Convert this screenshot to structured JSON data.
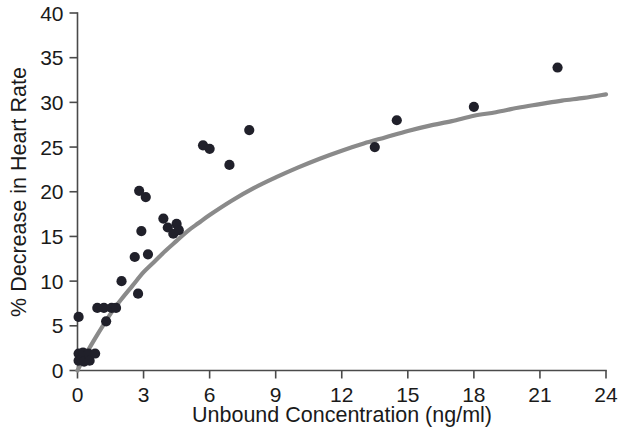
{
  "chart_data": {
    "type": "scatter",
    "title": "",
    "xlabel": "Unbound Concentration (ng/ml)",
    "ylabel": "% Decrease in Heart Rate",
    "xlim": [
      0,
      24
    ],
    "ylim": [
      0,
      40
    ],
    "xticks": [
      0,
      3,
      6,
      9,
      12,
      15,
      18,
      21,
      24
    ],
    "xtick_labels": [
      "0",
      "3",
      "6",
      "9",
      "12",
      "15",
      "18",
      "21",
      "24"
    ],
    "yticks": [
      0,
      5,
      10,
      15,
      20,
      25,
      30,
      35,
      40
    ],
    "ytick_labels": [
      "0",
      "5",
      "10",
      "15",
      "20",
      "25",
      "30",
      "35",
      "40"
    ],
    "grid": false,
    "legend": null,
    "marker": "filled-circle",
    "marker_color": "#20202a",
    "marker_size": 9,
    "curve_color": "#8a8a8a",
    "curve_label": "Emax fitted curve",
    "points": [
      {
        "x": 0.05,
        "y": 6.0
      },
      {
        "x": 0.05,
        "y": 1.9
      },
      {
        "x": 0.05,
        "y": 1.1
      },
      {
        "x": 0.25,
        "y": 2.0
      },
      {
        "x": 0.3,
        "y": 1.0
      },
      {
        "x": 0.5,
        "y": 1.9
      },
      {
        "x": 0.55,
        "y": 1.1
      },
      {
        "x": 0.8,
        "y": 1.9
      },
      {
        "x": 0.9,
        "y": 7.0
      },
      {
        "x": 1.2,
        "y": 7.0
      },
      {
        "x": 1.3,
        "y": 5.5
      },
      {
        "x": 1.55,
        "y": 7.0
      },
      {
        "x": 1.75,
        "y": 7.0
      },
      {
        "x": 2.0,
        "y": 10.0
      },
      {
        "x": 2.6,
        "y": 12.7
      },
      {
        "x": 2.75,
        "y": 8.6
      },
      {
        "x": 2.8,
        "y": 20.1
      },
      {
        "x": 2.9,
        "y": 15.6
      },
      {
        "x": 3.1,
        "y": 19.4
      },
      {
        "x": 3.2,
        "y": 13.0
      },
      {
        "x": 3.9,
        "y": 17.0
      },
      {
        "x": 4.1,
        "y": 16.0
      },
      {
        "x": 4.35,
        "y": 15.3
      },
      {
        "x": 4.5,
        "y": 16.4
      },
      {
        "x": 4.6,
        "y": 15.7
      },
      {
        "x": 5.7,
        "y": 25.2
      },
      {
        "x": 6.0,
        "y": 24.8
      },
      {
        "x": 6.9,
        "y": 23.0
      },
      {
        "x": 7.8,
        "y": 26.9
      },
      {
        "x": 13.5,
        "y": 25.0
      },
      {
        "x": 14.5,
        "y": 28.0
      },
      {
        "x": 18.0,
        "y": 29.5
      },
      {
        "x": 21.8,
        "y": 33.9
      }
    ],
    "curve": {
      "model": "Emax",
      "emax": 42.0,
      "ec50": 8.5,
      "points": [
        {
          "x": 0.0,
          "y": 0.0
        },
        {
          "x": 0.4,
          "y": 1.9
        },
        {
          "x": 0.8,
          "y": 3.6
        },
        {
          "x": 1.2,
          "y": 5.2
        },
        {
          "x": 1.6,
          "y": 6.7
        },
        {
          "x": 2.0,
          "y": 8.0
        },
        {
          "x": 2.5,
          "y": 9.5
        },
        {
          "x": 3.0,
          "y": 11.0
        },
        {
          "x": 3.5,
          "y": 12.2
        },
        {
          "x": 4.0,
          "y": 13.4
        },
        {
          "x": 4.5,
          "y": 14.5
        },
        {
          "x": 5.0,
          "y": 15.6
        },
        {
          "x": 5.5,
          "y": 16.5
        },
        {
          "x": 6.0,
          "y": 17.4
        },
        {
          "x": 7.0,
          "y": 19.0
        },
        {
          "x": 8.0,
          "y": 20.4
        },
        {
          "x": 9.0,
          "y": 21.6
        },
        {
          "x": 10.0,
          "y": 22.7
        },
        {
          "x": 11.0,
          "y": 23.7
        },
        {
          "x": 12.0,
          "y": 24.6
        },
        {
          "x": 13.0,
          "y": 25.4
        },
        {
          "x": 14.0,
          "y": 26.1
        },
        {
          "x": 15.0,
          "y": 26.8
        },
        {
          "x": 16.0,
          "y": 27.4
        },
        {
          "x": 17.0,
          "y": 27.9
        },
        {
          "x": 18.0,
          "y": 28.5
        },
        {
          "x": 19.0,
          "y": 28.9
        },
        {
          "x": 20.0,
          "y": 29.4
        },
        {
          "x": 21.0,
          "y": 29.8
        },
        {
          "x": 22.0,
          "y": 30.2
        },
        {
          "x": 23.0,
          "y": 30.5
        },
        {
          "x": 24.0,
          "y": 30.9
        }
      ]
    }
  },
  "axes": {
    "x_title": "Unbound Concentration (ng/ml)",
    "y_title": "% Decrease in Heart Rate"
  }
}
